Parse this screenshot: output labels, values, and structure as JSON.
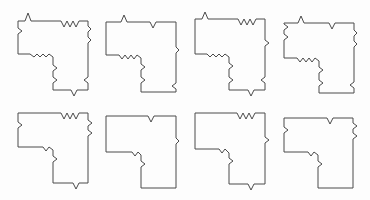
{
  "figure": {
    "stroke_color": "#4a4a4a",
    "background_color": "#fdfdfd"
  },
  "shapes": [
    {
      "id": "shape-1",
      "row": 1,
      "col": 1,
      "d": "M18,21 L25,21 L28,13 L31,21 L61,21 L64,27 L67,21 L70,27 L73,21 L76,27 L79,21 L88,21 L88,26 L91,29 L88,32 L88,37 L91,40 L88,43 L88,77 L84,80 L88,83 L88,90 L77,90 L74,96 L71,90 L53,90 L53,83 L57,80 L53,77 L53,71 L57,68 L53,65 L53,57 L49,54 L46,57 L43,54 L40,57 L37,54 L34,57 L30,54 L18,54 L18,34 L22,31 L18,28 Z"
    },
    {
      "id": "shape-2",
      "row": 1,
      "col": 2,
      "d": "M106,22 L121,22 L124,15 L127,22 L150,22 L153,28 L156,22 L176,22 L176,47 L179,50 L176,53 L176,83 L172,86 L176,89 L176,92 L141,92 L141,83 L145,80 L141,77 L141,70 L145,67 L141,64 L141,58 L137,55 L134,59 L131,55 L128,59 L125,55 L122,59 L119,55 L106,55 Z"
    },
    {
      "id": "shape-3",
      "row": 1,
      "col": 3,
      "d": "M195,19 L202,19 L205,12 L208,19 L238,19 L241,25 L244,19 L247,25 L250,19 L253,25 L256,19 L265,19 L265,40 L269,43 L265,46 L265,77 L261,80 L265,83 L265,90 L254,90 L251,96 L248,90 L229,90 L229,83 L233,80 L229,77 L229,69 L233,66 L229,63 L229,57 L225,54 L222,57 L219,54 L216,57 L213,54 L210,57 L207,54 L195,54 Z"
    },
    {
      "id": "shape-4",
      "row": 1,
      "col": 4,
      "d": "M284,23 L298,23 L301,16 L304,23 L329,23 L332,29 L335,23 L354,23 L354,30 L357,33 L354,36 L354,41 L357,44 L354,47 L354,82 L350,85 L354,88 L354,93 L319,93 L319,86 L323,83 L319,80 L319,73 L323,70 L319,67 L319,61 L315,58 L312,62 L309,58 L306,62 L303,58 L300,62 L297,58 L284,58 L284,40 L288,37 L284,34 L284,30 L288,27 L284,24 Z"
    },
    {
      "id": "shape-5",
      "row": 2,
      "col": 1,
      "d": "M18,113 L61,113 L64,119 L67,113 L70,119 L73,113 L76,119 L79,113 L88,113 L88,120 L92,123 L88,126 L88,130 L92,133 L88,136 L88,183 L79,183 L76,189 L73,183 L53,183 L53,162 L57,159 L53,156 L53,150 L49,147 L46,151 L43,147 L34,147 L18,147 L18,128 L22,125 L18,122 Z"
    },
    {
      "id": "shape-6",
      "row": 2,
      "col": 2,
      "d": "M106,116 L148,116 L151,122 L154,116 L176,116 L176,138 L179,141 L176,144 L176,188 L141,188 L141,167 L145,164 L141,161 L141,155 L138,152 L135,156 L132,152 L128,152 L106,152 Z"
    },
    {
      "id": "shape-7",
      "row": 2,
      "col": 3,
      "d": "M195,113 L237,113 L240,119 L243,113 L246,119 L249,113 L252,119 L255,113 L265,113 L265,137 L269,140 L265,143 L265,184 L254,184 L251,190 L248,184 L229,184 L229,164 L233,161 L229,158 L229,153 L225,149 L222,153 L219,149 L216,149 L195,149 Z"
    },
    {
      "id": "shape-8",
      "row": 2,
      "col": 4,
      "d": "M284,118 L327,118 L330,124 L333,118 L353,118 L353,123 L357,126 L353,129 L353,133 L357,136 L353,139 L353,188 L318,188 L318,167 L322,164 L318,161 L318,155 L314,152 L311,156 L308,152 L304,152 L284,152 L284,133 L288,130 L284,127 Z"
    }
  ]
}
